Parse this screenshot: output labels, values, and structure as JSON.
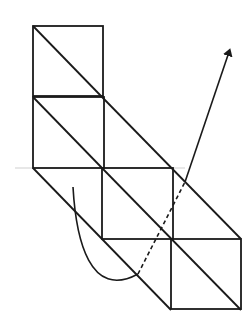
{
  "diagram": {
    "colors": {
      "stroke": "#1a1a1a",
      "reference_line": "#d0d0d0",
      "background": "#ffffff"
    },
    "squares": [
      {
        "id": "A",
        "x": 33,
        "y": 26,
        "size": 70
      },
      {
        "id": "B",
        "x": 33,
        "y": 97,
        "size": 71
      },
      {
        "id": "C",
        "x": 102,
        "y": 168,
        "size": 71
      },
      {
        "id": "D",
        "x": 171,
        "y": 239,
        "size": 70
      }
    ],
    "diagonals": [
      {
        "x1": 33,
        "y1": 26,
        "x2": 102,
        "y2": 97
      },
      {
        "x1": 33,
        "y1": 97,
        "x2": 102,
        "y2": 168
      },
      {
        "x1": 102,
        "y1": 97,
        "x2": 241,
        "y2": 239
      },
      {
        "x1": 33,
        "y1": 168,
        "x2": 171,
        "y2": 310
      },
      {
        "x1": 102,
        "y1": 168,
        "x2": 241,
        "y2": 310
      }
    ],
    "reference_line": {
      "x1": 15,
      "y1": 168,
      "x2": 185,
      "y2": 168
    },
    "curve": {
      "solid_path": "M 73 187 C 76 240, 90 300, 138 274",
      "dashed_path": "M 138 274 L 185 182",
      "arrow_path": "M 185 182 L 229 52",
      "arrow_tip": {
        "x": 230,
        "y": 49
      }
    }
  }
}
